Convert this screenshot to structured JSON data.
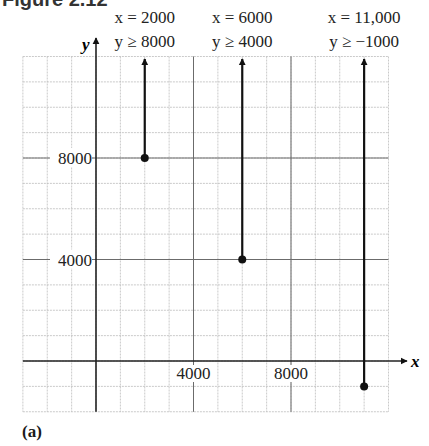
{
  "figure": {
    "heading": "Figure 2.12",
    "caption": "(a)"
  },
  "chart_data": {
    "type": "line",
    "title": "",
    "xlabel": "x",
    "ylabel": "y",
    "xlim": [
      -3000,
      12000
    ],
    "ylim": [
      -2000,
      12000
    ],
    "grid": true,
    "grid_step": 1000,
    "x_ticks": [
      {
        "value": 4000,
        "label": "4000"
      },
      {
        "value": 8000,
        "label": "8000"
      }
    ],
    "y_ticks": [
      {
        "value": 8000,
        "label": "8000"
      },
      {
        "value": 4000,
        "label": "4000"
      }
    ],
    "series": [
      {
        "name": "x = 2000, y ≥ 8000",
        "x": 2000,
        "y_start": 8000,
        "direction": "up",
        "label_line1": "x = 2000",
        "label_line2": "y ≥ 8000"
      },
      {
        "name": "x = 6000, y ≥ 4000",
        "x": 6000,
        "y_start": 4000,
        "direction": "up",
        "label_line1": "x = 6000",
        "label_line2": "y ≥ 4000"
      },
      {
        "name": "x = 11,000, y ≥ −1000",
        "x": 11000,
        "y_start": -1000,
        "direction": "up",
        "label_line1": "x = 11,000",
        "label_line2": "y ≥ −1000"
      }
    ]
  }
}
